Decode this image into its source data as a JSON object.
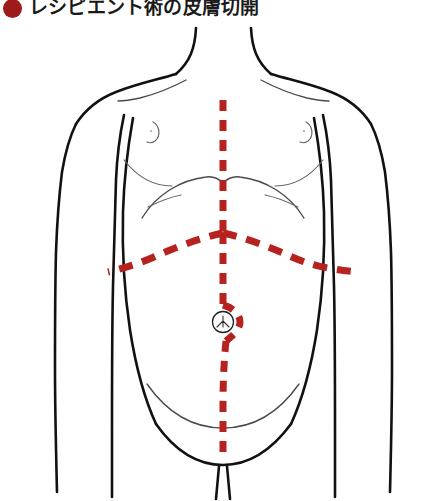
{
  "title": {
    "bullet_icon": "red-circle-bullet",
    "text": "レシピエント術の皮膚切開",
    "bullet_color": "#9e1b1b",
    "text_color": "#1a1a1a"
  },
  "illustration": {
    "name": "torso-anterior-view",
    "description": "前面から見た体幹の図",
    "background_color": "#ffffff",
    "outline_color": "#111111",
    "detail_color": "#4a4a4a",
    "incision_color": "#b5221f",
    "parts": [
      {
        "name": "neck",
        "label": "頸部"
      },
      {
        "name": "left-shoulder",
        "label": "左肩"
      },
      {
        "name": "right-shoulder",
        "label": "右肩"
      },
      {
        "name": "left-arm",
        "label": "左上肢"
      },
      {
        "name": "right-arm",
        "label": "右上肢"
      },
      {
        "name": "chest",
        "label": "胸部"
      },
      {
        "name": "left-nipple",
        "label": "左乳頭"
      },
      {
        "name": "right-nipple",
        "label": "右乳頭"
      },
      {
        "name": "costal-margin",
        "label": "肋骨弓"
      },
      {
        "name": "abdomen",
        "label": "腹部"
      },
      {
        "name": "umbilicus",
        "label": "臍"
      },
      {
        "name": "inguinal-crease",
        "label": "鼠径部"
      },
      {
        "name": "pubis",
        "label": "恥骨部"
      }
    ],
    "incisions": [
      {
        "name": "midline-incision",
        "label": "正中切開",
        "style": "dashed",
        "color": "#b5221f"
      },
      {
        "name": "chevron-incision",
        "label": "逆L字・シェブロン切開",
        "style": "dashed",
        "color": "#b5221f"
      }
    ]
  }
}
